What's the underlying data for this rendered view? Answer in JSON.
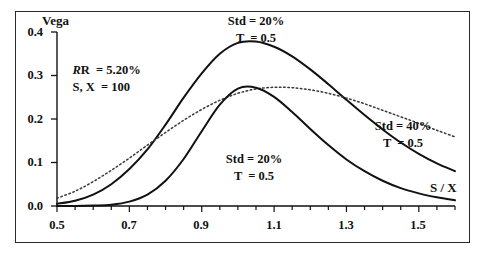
{
  "figure": {
    "axis_x_title": "S / X",
    "axis_y_title": "Vega",
    "frame_color": "#2b2b2b",
    "curve_color": "#111111",
    "dotted_color": "#3a3a3a"
  },
  "parameters": {
    "rate_line": "R  = 5.20%",
    "spot_strike_line": "S, X  = 100"
  },
  "labels": {
    "top_curve_l1": "Std = 20%",
    "top_curve_l2": "T  = 0.5",
    "right_curve_l1": "Std = 40%",
    "right_curve_l2": "T  = 0.5",
    "bottom_curve_l1": "Std = 20%",
    "bottom_curve_l2": "T  = 0.5"
  },
  "chart_data": {
    "type": "line",
    "title": "",
    "xlabel": "S / X",
    "ylabel": "Vega",
    "xlim": [
      0.5,
      1.6
    ],
    "ylim": [
      0.0,
      0.4
    ],
    "xticks": [
      0.5,
      0.7,
      0.9,
      1.1,
      1.3,
      1.5
    ],
    "xticks_minor_step": 0.05,
    "yticks": [
      0.0,
      0.1,
      0.2,
      0.3,
      0.4
    ],
    "grid": false,
    "legend": "annotations",
    "annotations": [
      {
        "text": "R  = 5.20%",
        "x": 0.6,
        "y": 0.345
      },
      {
        "text": "S, X  = 100",
        "x": 0.6,
        "y": 0.305
      },
      {
        "text": "Std = 20%",
        "x": 1.02,
        "y": 0.415
      },
      {
        "text": "T  = 0.5",
        "x": 1.02,
        "y": 0.382
      },
      {
        "text": "Std = 40%",
        "x": 1.4,
        "y": 0.205
      },
      {
        "text": "T  = 0.5",
        "x": 1.4,
        "y": 0.172
      },
      {
        "text": "Std = 20%",
        "x": 1.02,
        "y": 0.092
      },
      {
        "text": "T  = 0.5",
        "x": 1.02,
        "y": 0.06
      }
    ],
    "series": [
      {
        "name": "Std = 20%, T = 0.5 (upper)",
        "style": "solid",
        "x": [
          0.5,
          0.55,
          0.6,
          0.65,
          0.7,
          0.75,
          0.8,
          0.85,
          0.9,
          0.95,
          1.0,
          1.05,
          1.1,
          1.15,
          1.2,
          1.25,
          1.3,
          1.35,
          1.4,
          1.45,
          1.5,
          1.55,
          1.6
        ],
        "y": [
          0.005,
          0.012,
          0.026,
          0.05,
          0.085,
          0.13,
          0.187,
          0.249,
          0.305,
          0.35,
          0.375,
          0.378,
          0.366,
          0.344,
          0.314,
          0.28,
          0.244,
          0.209,
          0.176,
          0.146,
          0.12,
          0.098,
          0.08
        ]
      },
      {
        "name": "Std = 40%, T = 0.5 (dotted)",
        "style": "dotted",
        "x": [
          0.5,
          0.55,
          0.6,
          0.65,
          0.7,
          0.75,
          0.8,
          0.85,
          0.9,
          0.95,
          1.0,
          1.05,
          1.1,
          1.15,
          1.2,
          1.25,
          1.3,
          1.35,
          1.4,
          1.45,
          1.5,
          1.55,
          1.6
        ],
        "y": [
          0.018,
          0.034,
          0.056,
          0.082,
          0.11,
          0.14,
          0.169,
          0.197,
          0.222,
          0.243,
          0.259,
          0.269,
          0.273,
          0.272,
          0.267,
          0.259,
          0.248,
          0.235,
          0.22,
          0.205,
          0.19,
          0.174,
          0.159
        ]
      },
      {
        "name": "Std = 20%, T = 0.5 (lower)",
        "style": "solid",
        "x": [
          0.5,
          0.55,
          0.6,
          0.65,
          0.7,
          0.75,
          0.8,
          0.85,
          0.9,
          0.95,
          1.0,
          1.05,
          1.1,
          1.15,
          1.2,
          1.25,
          1.3,
          1.35,
          1.4,
          1.45,
          1.5,
          1.55,
          1.6
        ],
        "y": [
          0.0,
          0.0,
          0.001,
          0.003,
          0.01,
          0.026,
          0.058,
          0.108,
          0.172,
          0.233,
          0.27,
          0.272,
          0.251,
          0.216,
          0.177,
          0.14,
          0.107,
          0.08,
          0.058,
          0.041,
          0.029,
          0.02,
          0.013
        ]
      }
    ]
  }
}
